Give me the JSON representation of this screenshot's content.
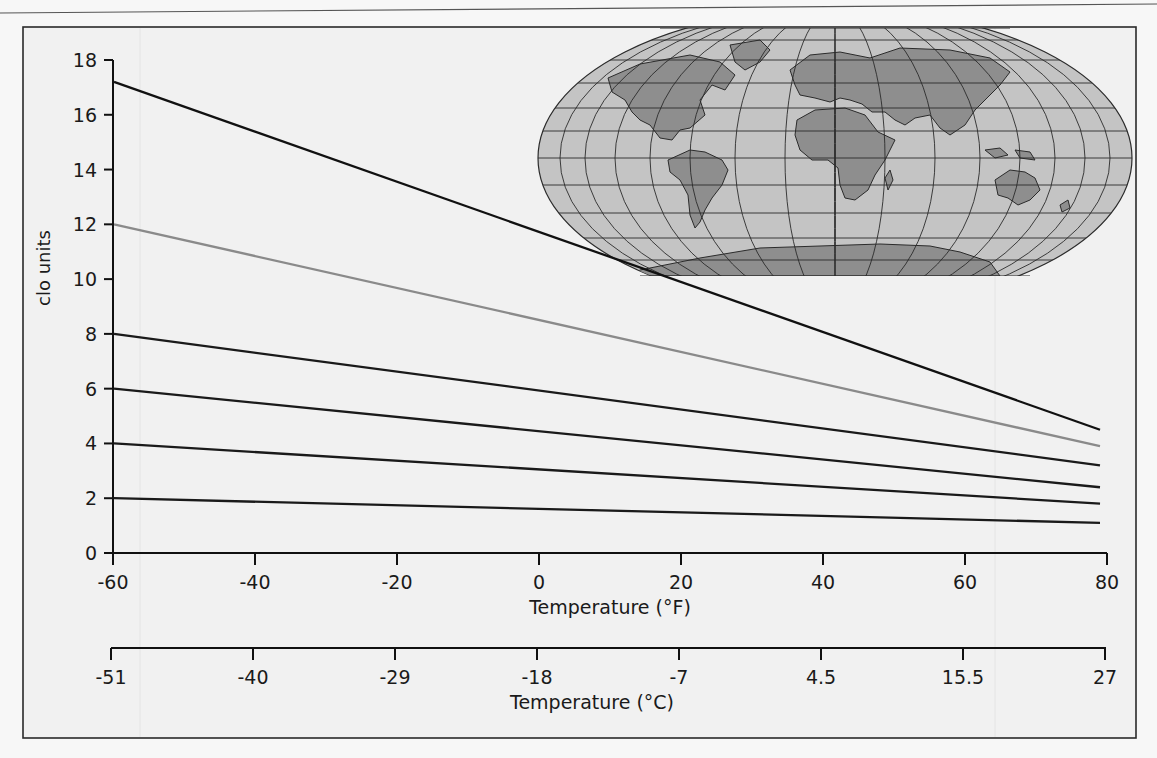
{
  "chart_data": {
    "type": "line",
    "title": "",
    "xlabel": "Temperature (°F)",
    "x2label": "Temperature (°C)",
    "ylabel": "clo units",
    "xlim": [
      -60,
      80
    ],
    "ylim": [
      0,
      18
    ],
    "grid": false,
    "legend": null,
    "x_ticks": [
      -60,
      -40,
      -20,
      0,
      20,
      40,
      60,
      80
    ],
    "x_tick_labels": [
      "-60",
      "-40",
      "-20",
      "0",
      "20",
      "40",
      "60",
      "80"
    ],
    "x2_tick_labels": [
      "-51",
      "-40",
      "-29",
      "-18",
      "-7",
      "4.5",
      "15.5",
      "27"
    ],
    "y_ticks": [
      0,
      2,
      4,
      6,
      8,
      10,
      12,
      14,
      16,
      18
    ],
    "y_tick_labels": [
      "0",
      "2",
      "4",
      "6",
      "8",
      "10",
      "12",
      "14",
      "16",
      "18"
    ],
    "x": [
      -60,
      80
    ],
    "series": [
      {
        "name": "line-1",
        "color": "#111111",
        "values": [
          17.2,
          4.5
        ]
      },
      {
        "name": "line-2",
        "color": "#8a8a8a",
        "values": [
          12,
          3.9
        ]
      },
      {
        "name": "line-3",
        "color": "#1a1a1a",
        "values": [
          8,
          3.2
        ]
      },
      {
        "name": "line-4",
        "color": "#1a1a1a",
        "values": [
          6,
          2.4
        ]
      },
      {
        "name": "line-5",
        "color": "#1a1a1a",
        "values": [
          4,
          1.8
        ]
      },
      {
        "name": "line-6",
        "color": "#1a1a1a",
        "values": [
          2,
          1.1
        ]
      }
    ],
    "annotations": [
      "world map inset (upper right)"
    ]
  },
  "colors": {
    "background": "#f2f2f2",
    "frame": "#2a2a2a",
    "map_ocean": "#c4c4c4",
    "map_land": "#8e8e8e",
    "map_grid": "#2b2b2b"
  }
}
